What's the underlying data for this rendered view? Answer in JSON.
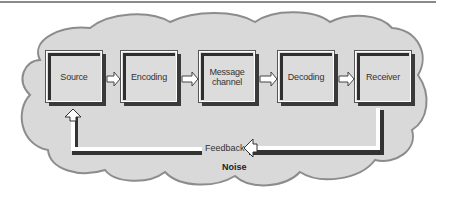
{
  "diagram": {
    "boxes": [
      {
        "label": "Source"
      },
      {
        "label": "Encoding"
      },
      {
        "label": "Message channel",
        "line1": "Message",
        "line2": "channel"
      },
      {
        "label": "Decoding"
      },
      {
        "label": "Receiver"
      }
    ],
    "feedback_label": "Feedback",
    "noise_label": "Noise",
    "flow": [
      {
        "from": "Source",
        "to": "Encoding"
      },
      {
        "from": "Encoding",
        "to": "Message channel"
      },
      {
        "from": "Message channel",
        "to": "Decoding"
      },
      {
        "from": "Decoding",
        "to": "Receiver"
      },
      {
        "from": "Receiver",
        "to": "Source",
        "via": "Feedback"
      }
    ],
    "colors": {
      "cloud_fill": "#d9d9d9",
      "cloud_stroke": "#8c8c8c",
      "box_face": "#dcdcdc",
      "box_shadow": "#3a3a3a",
      "arrow_fill": "#ffffff",
      "text": "#333333"
    }
  }
}
